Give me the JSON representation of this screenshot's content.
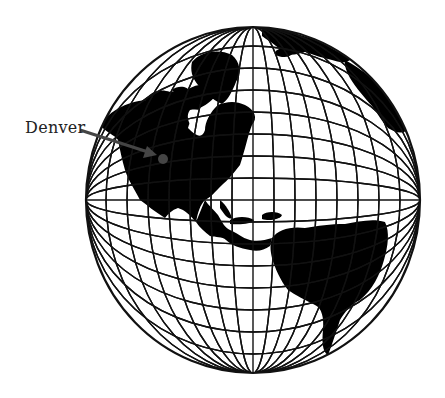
{
  "map": {
    "title": "Globe showing the Western Hemisphere with Denver marked",
    "globe": {
      "cx": 253,
      "cy": 200,
      "rx": 167,
      "ry": 173,
      "outline_color": "#111111",
      "land_color": "#000000",
      "ocean_color": "#ffffff",
      "meridian_offsets": [
        -147,
        -126,
        -105,
        -84,
        -63,
        -42,
        -21,
        0,
        21,
        42,
        63,
        84,
        105,
        126,
        147
      ],
      "parallel_offsets": [
        -154,
        -132,
        -110,
        -88,
        -66,
        -44,
        -22,
        0,
        22,
        44,
        66,
        88,
        110,
        132,
        154
      ]
    },
    "continents": [
      "North America",
      "Greenland",
      "Central America",
      "Caribbean",
      "South America",
      "Europe",
      "Africa"
    ],
    "marker": {
      "label": "Denver",
      "x": 163,
      "y": 159,
      "r": 5,
      "color": "#454545",
      "arrow_from": [
        80,
        130
      ],
      "arrow_to": [
        156,
        155
      ]
    }
  }
}
